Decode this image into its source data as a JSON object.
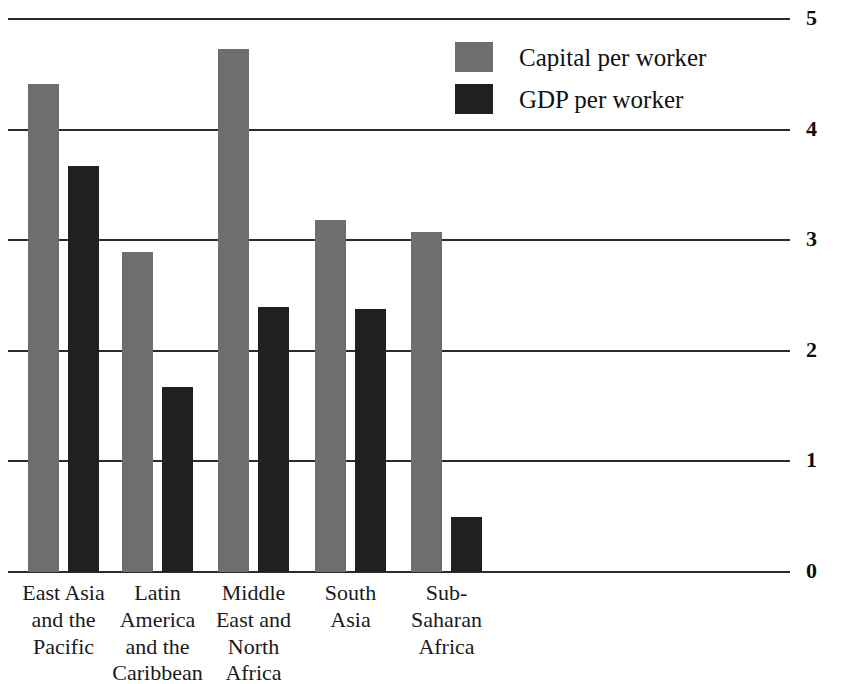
{
  "chart_data": {
    "type": "bar",
    "title": "",
    "xlabel": "",
    "ylabel": "",
    "ylim": [
      0,
      5
    ],
    "yticks": [
      "0",
      "1",
      "2",
      "3",
      "4",
      "5"
    ],
    "grid": true,
    "legend_position": "top-center-right",
    "categories": [
      "East Asia and the Pacific",
      "Latin America and the Caribbean",
      "Middle East and North Africa",
      "South Asia",
      "Sub-Saharan Africa"
    ],
    "category_lines": [
      [
        "East Asia",
        "and the",
        "Pacific"
      ],
      [
        "Latin",
        "America",
        "and the",
        "Caribbean"
      ],
      [
        "Middle",
        "East and",
        "North",
        "Africa"
      ],
      [
        "South",
        "Asia"
      ],
      [
        "Sub-",
        "Saharan",
        "Africa"
      ]
    ],
    "series": [
      {
        "name": "Capital per worker",
        "color": "#6e6e6e",
        "values": [
          4.41,
          2.89,
          4.73,
          3.18,
          3.07
        ]
      },
      {
        "name": "GDP per worker",
        "color": "#211f1f",
        "values": [
          3.67,
          1.67,
          2.4,
          2.38,
          0.5
        ]
      }
    ]
  }
}
